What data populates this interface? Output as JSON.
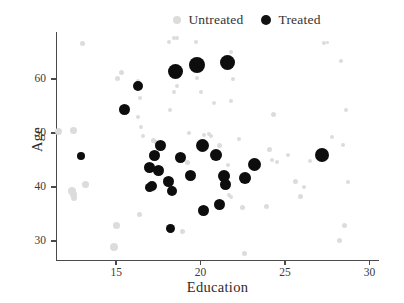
{
  "chart": {
    "type": "scatter",
    "title": "",
    "xlabel": "Education",
    "ylabel": "Age"
  },
  "legend": {
    "position": "top-center",
    "entries": [
      {
        "label": "Untreated",
        "color": "#dcdcdc",
        "marker": "circle-small"
      },
      {
        "label": "Treated",
        "color": "#0d0d0d",
        "marker": "circle-large"
      }
    ]
  },
  "axes": {
    "x": {
      "label": "Education",
      "ticks": [
        "15",
        "20",
        "25",
        "30"
      ],
      "min": 11.5,
      "max": 30.5
    },
    "y": {
      "label": "Age",
      "ticks": [
        "30",
        "40",
        "50",
        "60"
      ],
      "min": 26.5,
      "max": 68.5
    }
  },
  "chart_data": {
    "type": "scatter",
    "title": "",
    "xlabel": "Education",
    "ylabel": "Age",
    "xlim": [
      11.5,
      30.5
    ],
    "ylim": [
      26.5,
      68.5
    ],
    "xticks": [
      15,
      20,
      25,
      30
    ],
    "yticks": [
      30,
      40,
      50,
      60
    ],
    "grid": false,
    "legend_position": "top-center",
    "marker_size_encodes": "weight",
    "series": [
      {
        "name": "Untreated",
        "color": "#dcdcdc",
        "points": [
          {
            "x": 11.6,
            "y": 50.2,
            "s": 7
          },
          {
            "x": 12.5,
            "y": 50.4,
            "s": 7
          },
          {
            "x": 12.4,
            "y": 39.3,
            "s": 8
          },
          {
            "x": 12.5,
            "y": 38.6,
            "s": 7
          },
          {
            "x": 12.5,
            "y": 37.9,
            "s": 6
          },
          {
            "x": 13.2,
            "y": 40.4,
            "s": 7
          },
          {
            "x": 13.0,
            "y": 66.6,
            "s": 5
          },
          {
            "x": 15.0,
            "y": 32.9,
            "s": 7
          },
          {
            "x": 14.9,
            "y": 28.9,
            "s": 8
          },
          {
            "x": 15.3,
            "y": 61.2,
            "s": 5
          },
          {
            "x": 15.1,
            "y": 60.1,
            "s": 5
          },
          {
            "x": 16.3,
            "y": 59.7,
            "s": 4
          },
          {
            "x": 16.4,
            "y": 56.4,
            "s": 4
          },
          {
            "x": 16.3,
            "y": 53.0,
            "s": 4
          },
          {
            "x": 16.5,
            "y": 51.2,
            "s": 4
          },
          {
            "x": 16.6,
            "y": 49.4,
            "s": 4
          },
          {
            "x": 16.4,
            "y": 34.9,
            "s": 5
          },
          {
            "x": 17.2,
            "y": 48.6,
            "s": 5
          },
          {
            "x": 17.4,
            "y": 48.2,
            "s": 5
          },
          {
            "x": 17.0,
            "y": 40.3,
            "s": 6
          },
          {
            "x": 17.1,
            "y": 39.7,
            "s": 6
          },
          {
            "x": 17.9,
            "y": 41.4,
            "s": 5
          },
          {
            "x": 18.1,
            "y": 40.9,
            "s": 5
          },
          {
            "x": 18.4,
            "y": 67.6,
            "s": 4
          },
          {
            "x": 18.6,
            "y": 67.6,
            "s": 4
          },
          {
            "x": 18.1,
            "y": 66.9,
            "s": 4
          },
          {
            "x": 18.6,
            "y": 58.7,
            "s": 4
          },
          {
            "x": 18.4,
            "y": 57.5,
            "s": 4
          },
          {
            "x": 18.2,
            "y": 54.2,
            "s": 4
          },
          {
            "x": 18.9,
            "y": 31.8,
            "s": 5
          },
          {
            "x": 19.2,
            "y": 44.6,
            "s": 5
          },
          {
            "x": 19.3,
            "y": 50.0,
            "s": 4
          },
          {
            "x": 19.7,
            "y": 66.9,
            "s": 4
          },
          {
            "x": 19.5,
            "y": 62.5,
            "s": 4
          },
          {
            "x": 19.8,
            "y": 60.2,
            "s": 4
          },
          {
            "x": 20.0,
            "y": 57.5,
            "s": 4
          },
          {
            "x": 20.2,
            "y": 49.7,
            "s": 4
          },
          {
            "x": 20.5,
            "y": 49.9,
            "s": 4
          },
          {
            "x": 20.6,
            "y": 49.5,
            "s": 4
          },
          {
            "x": 20.8,
            "y": 55.6,
            "s": 4
          },
          {
            "x": 21.1,
            "y": 47.7,
            "s": 5
          },
          {
            "x": 21.5,
            "y": 63.0,
            "s": 5
          },
          {
            "x": 21.8,
            "y": 64.9,
            "s": 4
          },
          {
            "x": 21.9,
            "y": 59.9,
            "s": 4
          },
          {
            "x": 21.8,
            "y": 56.0,
            "s": 4
          },
          {
            "x": 21.6,
            "y": 44.0,
            "s": 4
          },
          {
            "x": 21.7,
            "y": 38.6,
            "s": 4
          },
          {
            "x": 21.8,
            "y": 38.1,
            "s": 4
          },
          {
            "x": 22.3,
            "y": 48.9,
            "s": 4
          },
          {
            "x": 22.5,
            "y": 36.2,
            "s": 5
          },
          {
            "x": 22.6,
            "y": 27.7,
            "s": 5
          },
          {
            "x": 23.9,
            "y": 36.4,
            "s": 5
          },
          {
            "x": 24.1,
            "y": 47.0,
            "s": 5
          },
          {
            "x": 24.2,
            "y": 45.0,
            "s": 4
          },
          {
            "x": 24.3,
            "y": 53.5,
            "s": 5
          },
          {
            "x": 24.5,
            "y": 44.7,
            "s": 4
          },
          {
            "x": 25.2,
            "y": 46.0,
            "s": 4
          },
          {
            "x": 25.6,
            "y": 41.1,
            "s": 5
          },
          {
            "x": 25.9,
            "y": 38.3,
            "s": 5
          },
          {
            "x": 26.1,
            "y": 40.0,
            "s": 4
          },
          {
            "x": 26.5,
            "y": 44.8,
            "s": 4
          },
          {
            "x": 27.3,
            "y": 66.6,
            "s": 4
          },
          {
            "x": 27.5,
            "y": 66.8,
            "s": 3
          },
          {
            "x": 27.8,
            "y": 49.2,
            "s": 4
          },
          {
            "x": 28.3,
            "y": 63.4,
            "s": 4
          },
          {
            "x": 28.6,
            "y": 54.3,
            "s": 4
          },
          {
            "x": 28.4,
            "y": 47.8,
            "s": 4
          },
          {
            "x": 28.7,
            "y": 41.0,
            "s": 4
          },
          {
            "x": 28.5,
            "y": 32.8,
            "s": 5
          },
          {
            "x": 28.2,
            "y": 30.1,
            "s": 5
          }
        ]
      },
      {
        "name": "Treated",
        "color": "#0d0d0d",
        "points": [
          {
            "x": 12.9,
            "y": 45.8,
            "s": 8
          },
          {
            "x": 15.5,
            "y": 54.4,
            "s": 11
          },
          {
            "x": 16.3,
            "y": 58.7,
            "s": 10
          },
          {
            "x": 17.0,
            "y": 43.6,
            "s": 11
          },
          {
            "x": 17.3,
            "y": 45.8,
            "s": 11
          },
          {
            "x": 17.1,
            "y": 40.2,
            "s": 10
          },
          {
            "x": 17.0,
            "y": 40.0,
            "s": 9
          },
          {
            "x": 17.5,
            "y": 43.1,
            "s": 11
          },
          {
            "x": 17.6,
            "y": 47.6,
            "s": 11
          },
          {
            "x": 18.1,
            "y": 41.0,
            "s": 11
          },
          {
            "x": 18.3,
            "y": 39.2,
            "s": 10
          },
          {
            "x": 18.2,
            "y": 32.4,
            "s": 9
          },
          {
            "x": 18.5,
            "y": 61.4,
            "s": 15
          },
          {
            "x": 18.8,
            "y": 45.4,
            "s": 11
          },
          {
            "x": 19.4,
            "y": 42.1,
            "s": 11
          },
          {
            "x": 19.8,
            "y": 62.6,
            "s": 16
          },
          {
            "x": 20.1,
            "y": 47.6,
            "s": 13
          },
          {
            "x": 20.2,
            "y": 35.6,
            "s": 11
          },
          {
            "x": 20.9,
            "y": 46.0,
            "s": 12
          },
          {
            "x": 21.1,
            "y": 36.8,
            "s": 11
          },
          {
            "x": 21.4,
            "y": 42.0,
            "s": 12
          },
          {
            "x": 21.5,
            "y": 40.4,
            "s": 11
          },
          {
            "x": 21.6,
            "y": 63.0,
            "s": 15
          },
          {
            "x": 22.6,
            "y": 41.7,
            "s": 12
          },
          {
            "x": 23.2,
            "y": 44.2,
            "s": 13
          },
          {
            "x": 27.2,
            "y": 45.9,
            "s": 14
          }
        ]
      }
    ]
  }
}
